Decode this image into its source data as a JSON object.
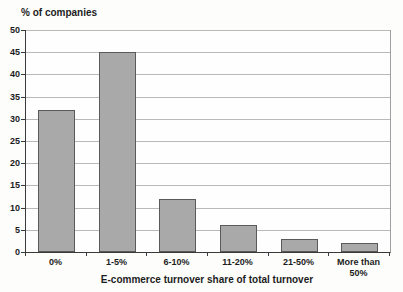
{
  "chart_data": {
    "type": "bar",
    "title": "",
    "ylabel": "% of companies",
    "xlabel": "E-commerce turnover share of total turnover",
    "categories": [
      "0%",
      "1-5%",
      "6-10%",
      "11-20%",
      "21-50%",
      "More than 50%"
    ],
    "values": [
      32,
      45,
      12,
      6,
      3,
      2
    ],
    "ylim": [
      0,
      50
    ],
    "ytick_step": 5,
    "grid": true,
    "legend": "none",
    "bar_color": "#a9a9a9",
    "bar_border_color": "#5a5a5a",
    "grid_color": "#b9b9b9",
    "axis_color": "#3a3a3a",
    "text_color": "#1c1c1c"
  }
}
